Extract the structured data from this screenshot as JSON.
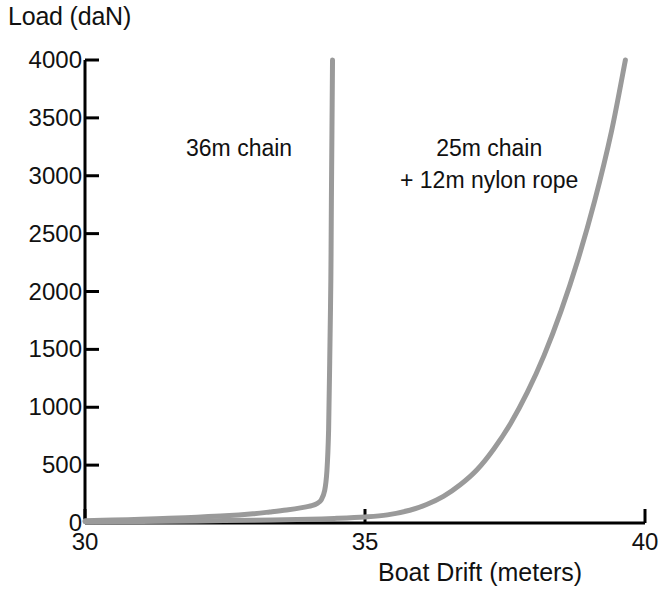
{
  "chart_data": {
    "type": "line",
    "title": "",
    "xlabel": "Boat Drift (meters)",
    "ylabel": "Load (daN)",
    "xlim": [
      30,
      40
    ],
    "ylim": [
      0,
      4000
    ],
    "xticks": [
      "30",
      "35",
      "40"
    ],
    "xtick_values": [
      30,
      35,
      40
    ],
    "yticks": [
      "0",
      "500",
      "1000",
      "1500",
      "2000",
      "2500",
      "3000",
      "3500",
      "4000"
    ],
    "ytick_values": [
      0,
      500,
      1000,
      1500,
      2000,
      2500,
      3000,
      3500,
      4000
    ],
    "grid": false,
    "legend": "annotations-inline",
    "line_color": "#9a9a9a",
    "axis_color": "#000000",
    "text_color": "#111111",
    "series": [
      {
        "name": "36m chain",
        "annotation": "36m chain",
        "color": "#9a9a9a",
        "x": [
          30.0,
          30.5,
          31.0,
          31.5,
          32.0,
          32.5,
          33.0,
          33.3,
          33.6,
          33.9,
          34.05,
          34.15,
          34.22,
          34.28,
          34.32,
          34.35,
          34.37,
          34.39,
          34.4,
          34.41,
          34.42
        ],
        "y": [
          20,
          25,
          32,
          40,
          50,
          62,
          80,
          95,
          112,
          135,
          150,
          170,
          200,
          280,
          450,
          800,
          1400,
          2100,
          2800,
          3400,
          4000
        ]
      },
      {
        "name": "25m chain + 12m nylon rope",
        "annotation_line1": "25m chain",
        "annotation_line2": "+ 12m nylon rope",
        "color": "#9a9a9a",
        "x": [
          30.0,
          31.0,
          32.0,
          33.0,
          34.0,
          34.5,
          35.0,
          35.4,
          35.8,
          36.1,
          36.4,
          36.7,
          37.0,
          37.3,
          37.6,
          37.9,
          38.2,
          38.5,
          38.8,
          39.1,
          39.4,
          39.65
        ],
        "y": [
          10,
          14,
          18,
          24,
          32,
          40,
          52,
          70,
          110,
          160,
          230,
          330,
          460,
          640,
          860,
          1130,
          1450,
          1830,
          2270,
          2780,
          3380,
          4000
        ]
      }
    ]
  },
  "annotations": {
    "first": "36m chain",
    "second_line1": "25m chain",
    "second_line2": "+ 12m nylon rope"
  },
  "axes": {
    "y_title": "Load (daN)",
    "x_title": "Boat Drift (meters)"
  }
}
